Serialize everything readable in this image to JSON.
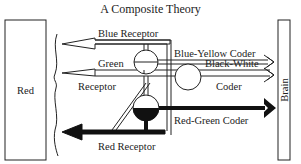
{
  "title": "A Composite Theory",
  "left_box": {
    "label": "Red"
  },
  "right_box": {
    "label": "Brain"
  },
  "receptors": [
    {
      "id": "blue",
      "label": "Blue Receptor",
      "style": "outline"
    },
    {
      "id": "green",
      "label_line1": "Green",
      "label_line2": "Receptor",
      "style": "outline"
    },
    {
      "id": "red",
      "label": "Red Receptor",
      "style": "solid"
    }
  ],
  "coders": [
    {
      "id": "blue-yellow",
      "label": "Blue-Yellow Coder",
      "style": "outline"
    },
    {
      "id": "black-white",
      "label_line1": "Black-White",
      "label_line2": "Coder",
      "style": "outline"
    },
    {
      "id": "red-green",
      "label": "Red-Green Coder",
      "style": "solid"
    }
  ],
  "colors": {
    "line": "#222222",
    "background": "#ffffff"
  }
}
